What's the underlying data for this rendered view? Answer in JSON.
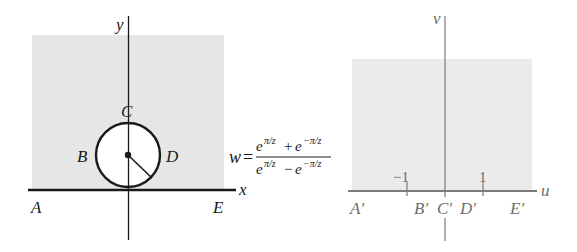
{
  "left_plane": {
    "axis_x_label": "x",
    "axis_y_label": "y",
    "points": {
      "A": "A",
      "B": "B",
      "C": "C",
      "D": "D",
      "E": "E"
    },
    "colors": {
      "shade": "#e6e6e6",
      "line": "#1a1a1a",
      "circle_fill": "#ffffff"
    }
  },
  "mapping": {
    "lhs": "w",
    "equals": "=",
    "numerator": {
      "t1_base": "e",
      "t1_exp": "π/z",
      "op": "+",
      "t2_base": "e",
      "t2_exp": "−π/z"
    },
    "denominator": {
      "t1_base": "e",
      "t1_exp": "π/z",
      "op": "−",
      "t2_base": "e",
      "t2_exp": "−π/z"
    }
  },
  "right_plane": {
    "axis_u_label": "u",
    "axis_v_label": "v",
    "ticks": {
      "neg": "−1",
      "pos": "1"
    },
    "points": {
      "A": "A′",
      "B": "B′",
      "C": "C′",
      "D": "D′",
      "E": "E′"
    },
    "colors": {
      "shade": "#ebebeb",
      "line": "#7a7a7a",
      "text": "#6e6e6e"
    }
  }
}
